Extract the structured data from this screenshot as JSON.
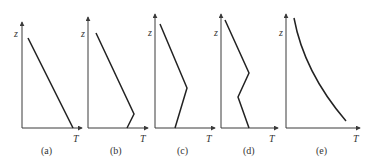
{
  "figure": {
    "panels": [
      {
        "id": "a",
        "caption": "(a)",
        "y_label": "z",
        "x_label": "T",
        "profile": "linear decrease of T with height"
      },
      {
        "id": "b",
        "caption": "(b)",
        "y_label": "z",
        "x_label": "T",
        "profile": "shallow surface inversion then linear decrease"
      },
      {
        "id": "c",
        "caption": "(c)",
        "y_label": "z",
        "x_label": "T",
        "profile": "deep inversion layer then decrease aloft"
      },
      {
        "id": "d",
        "caption": "(d)",
        "y_label": "z",
        "x_label": "T",
        "profile": "decrease, elevated inversion, then decrease"
      },
      {
        "id": "e",
        "caption": "(e)",
        "y_label": "z",
        "x_label": "T",
        "profile": "curved (nonlinear) decrease of T with height"
      }
    ]
  }
}
